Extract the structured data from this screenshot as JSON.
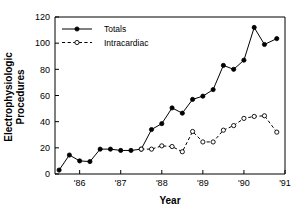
{
  "chart_data": {
    "type": "line",
    "title": "",
    "xlabel": "Year",
    "ylabel": "Electrophysiologic Procedures",
    "ylabel_line1": "Electrophysiologic",
    "ylabel_line2": "Procedures",
    "xlim": [
      1985.4,
      1991.0
    ],
    "ylim": [
      0,
      120
    ],
    "yticks": [
      0,
      20,
      40,
      60,
      80,
      100,
      120
    ],
    "ytick_labels": [
      "0",
      "20",
      "40",
      "60",
      "80",
      "100",
      "120"
    ],
    "xticks": [
      1986,
      1987,
      1988,
      1989,
      1990,
      1991
    ],
    "xtick_labels": [
      "'86",
      "'87",
      "'88",
      "'89",
      "'90",
      "'91"
    ],
    "grid": false,
    "legend_position": "top-left",
    "series": [
      {
        "name": "Totals",
        "marker": "filled-circle",
        "linestyle": "solid",
        "color": "#000000",
        "x": [
          1985.5,
          1985.75,
          1986.0,
          1986.25,
          1986.5,
          1986.75,
          1987.0,
          1987.25,
          1987.5,
          1987.75,
          1988.0,
          1988.25,
          1988.5,
          1988.75,
          1989.0,
          1989.25,
          1989.5,
          1989.75,
          1990.0,
          1990.25,
          1990.5,
          1990.8
        ],
        "values": [
          3,
          14.5,
          10,
          9.5,
          19,
          19,
          18,
          18,
          19,
          34,
          38.5,
          50.5,
          46.5,
          57,
          59.5,
          64.5,
          83,
          80,
          87,
          112,
          99,
          103.5
        ]
      },
      {
        "name": "Intracardiac",
        "marker": "open-circle",
        "linestyle": "dashed",
        "color": "#000000",
        "x": [
          1987.5,
          1987.75,
          1988.0,
          1988.25,
          1988.5,
          1988.75,
          1989.0,
          1989.25,
          1989.5,
          1989.75,
          1990.0,
          1990.25,
          1990.5,
          1990.8
        ],
        "values": [
          19,
          19,
          21.5,
          21,
          17,
          32.5,
          24.5,
          24.5,
          33.5,
          37,
          42.5,
          44,
          44.5,
          32
        ]
      }
    ]
  },
  "legend": {
    "entries": [
      {
        "label": "Totals"
      },
      {
        "label": "Intracardiac"
      }
    ]
  }
}
